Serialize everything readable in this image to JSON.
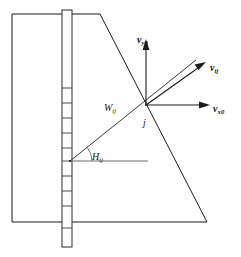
{
  "figure": {
    "type": "engineering-schematic",
    "background_color": "#ffffff",
    "line_color": "#1a1a1a",
    "width": 241,
    "height": 257
  },
  "labels": {
    "velocity_vertical": {
      "symbol": "v",
      "subscript": "y0",
      "full": "v y0"
    },
    "velocity_resultant": {
      "symbol": "v",
      "subscript": "ij",
      "full": "v ij"
    },
    "velocity_horizontal": {
      "symbol": "v",
      "subscript": "x0",
      "full": "v x0"
    },
    "wedge_width": {
      "symbol": "W",
      "subscript": "ij",
      "full": "W ij"
    },
    "node": {
      "symbol": "j",
      "subscript": "",
      "full": "j"
    },
    "angle": {
      "symbol": "H",
      "subscript": "ij",
      "full": "H ij"
    }
  },
  "geometry": {
    "soil_block": {
      "name": "soil-mass-outline",
      "points": "12,14 100,14 207,222 12,222"
    },
    "wedge_line": {
      "name": "failure-wedge-line",
      "from": [
        70,
        161
      ],
      "to": [
        196,
        60
      ]
    },
    "column": {
      "name": "segmented-pile-column",
      "x": 62,
      "y": 10,
      "width": 10,
      "height": 237,
      "rung_ys": [
        88,
        103,
        118,
        133,
        148,
        161,
        176,
        191,
        206
      ]
    },
    "reference_line": {
      "name": "horizontal-reference-line",
      "from": [
        70,
        161
      ],
      "to": [
        148,
        161
      ]
    },
    "vectors": {
      "vertical": {
        "from": [
          146,
          105
        ],
        "to": [
          146,
          44
        ]
      },
      "horizontal": {
        "from": [
          146,
          105
        ],
        "to": [
          208,
          105
        ]
      },
      "resultant": {
        "from": [
          146,
          105
        ],
        "to": [
          205,
          63
        ]
      }
    },
    "node_point": [
      146,
      105
    ],
    "angle_arc": {
      "center": [
        70,
        161
      ],
      "radius": 22,
      "start_deg": 0,
      "end_deg": 38
    }
  }
}
